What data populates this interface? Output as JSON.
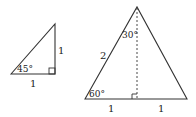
{
  "diagram": {
    "colors": {
      "stroke": "#333333",
      "text": "#222222",
      "background": "#ffffff"
    },
    "triangle_45": {
      "angle_label": "45°",
      "vertical_side_label": "1",
      "base_label": "1",
      "right_angle": true
    },
    "triangle_30_60": {
      "top_angle_label": "30°",
      "bottom_left_angle_label": "60°",
      "left_side_label": "2",
      "base_left_label": "1",
      "base_right_label": "1",
      "altitude_dashed": true,
      "right_angle": true
    }
  }
}
